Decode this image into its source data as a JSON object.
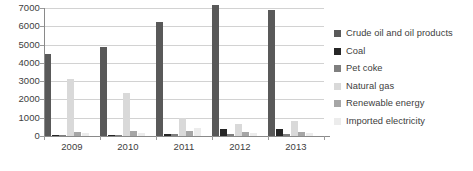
{
  "chart_data": {
    "type": "bar",
    "title": "",
    "subtitle": "",
    "xlabel": "",
    "ylabel": "",
    "categories": [
      "2009",
      "2010",
      "2011",
      "2012",
      "2013"
    ],
    "ylim": [
      0,
      7000
    ],
    "yticks": [
      0,
      1000,
      2000,
      3000,
      4000,
      5000,
      6000,
      7000
    ],
    "ytick_labels": [
      "0",
      "1000",
      "2000",
      "3000",
      "4000",
      "5000",
      "6000",
      "7000"
    ],
    "grid": true,
    "legend_position": "right",
    "series": [
      {
        "name": "Crude oil and oil products",
        "color": "#595959",
        "values": [
          4470,
          4850,
          6250,
          7150,
          6880
        ]
      },
      {
        "name": "Coal",
        "color": "#262626",
        "values": [
          60,
          70,
          110,
          400,
          390
        ]
      },
      {
        "name": "Pet coke",
        "color": "#7f7f7f",
        "values": [
          40,
          50,
          90,
          100,
          120
        ]
      },
      {
        "name": "Natural gas",
        "color": "#d9d9d9",
        "values": [
          3110,
          2350,
          980,
          640,
          800
        ]
      },
      {
        "name": "Renewable energy",
        "color": "#a6a6a6",
        "values": [
          220,
          250,
          300,
          210,
          230
        ]
      },
      {
        "name": "Imported electricity",
        "color": "#ececec",
        "values": [
          140,
          160,
          430,
          150,
          170
        ]
      }
    ]
  },
  "legend": {
    "items": [
      {
        "label": "Crude oil and oil products",
        "swatch": "legend-swatch-crude-oil"
      },
      {
        "label": "Coal",
        "swatch": "legend-swatch-coal"
      },
      {
        "label": "Pet coke",
        "swatch": "legend-swatch-pet-coke"
      },
      {
        "label": "Natural gas",
        "swatch": "legend-swatch-natural-gas"
      },
      {
        "label": "Renewable energy",
        "swatch": "legend-swatch-renewable-energy"
      },
      {
        "label": "Imported electricity",
        "swatch": "legend-swatch-imported-electricity"
      }
    ]
  }
}
